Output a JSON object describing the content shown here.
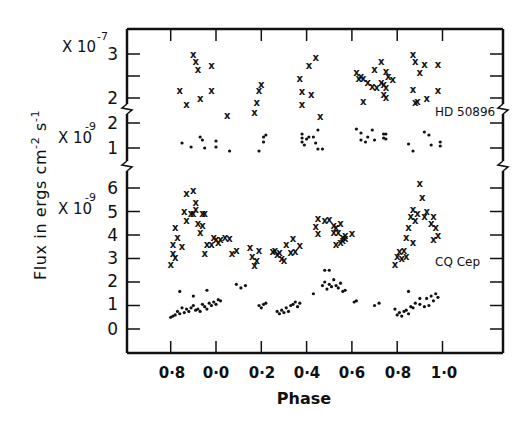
{
  "chart_data": {
    "type": "scatter",
    "title": "",
    "xlabel": "Phase",
    "ylabel": "Flux in ergs cm-2 s-1",
    "x_tick_labels": [
      "0·8",
      "0·0",
      "0·2",
      "0·4",
      "0·6",
      "0·8",
      "1·0"
    ],
    "x_tick_positions": [
      -0.2,
      0.0,
      0.2,
      0.4,
      0.6,
      0.8,
      1.0
    ],
    "xlim": [
      -0.394,
      1.266
    ],
    "grid": false,
    "panels": [
      {
        "name": "HD 50896 (crosses)",
        "scale_label": "X 10-7",
        "scale_base": "X 10",
        "scale_exp": "-7",
        "y_ticks": [
          2,
          3
        ],
        "y_minor_ticks": [
          2.5
        ],
        "ylim": [
          1.8,
          3.57
        ],
        "marker": "x"
      },
      {
        "name": "HD 50896 (dots)",
        "scale_label": "X 10-9",
        "scale_base": "X 10",
        "scale_exp": "-9",
        "y_ticks": [
          1,
          2
        ],
        "ylim": [
          0.32,
          2.64
        ],
        "marker": "dot"
      },
      {
        "name": "CQ Cep",
        "scale_label": "X 10-9",
        "scale_base": "X 10",
        "scale_exp": "-9",
        "y_ticks": [
          0,
          1,
          2,
          3,
          4,
          5,
          6
        ],
        "ylim": [
          -1.0,
          6.9
        ],
        "marker": "both"
      }
    ],
    "annotations": [
      "HD 50896",
      "CQ Cep"
    ],
    "series": [
      {
        "name": "HD 50896 crosses (x10^-7)",
        "panel": 0,
        "marker": "x",
        "x": [
          -0.1,
          -0.09,
          -0.08,
          -0.02,
          -0.16,
          -0.02,
          -0.07,
          -0.13,
          0.05,
          0.19,
          0.18,
          0.17,
          0.2,
          0.37,
          0.41,
          0.44,
          0.38,
          0.42,
          0.38,
          0.46,
          0.62,
          0.64,
          0.63,
          0.65,
          0.67,
          0.69,
          0.7,
          0.71,
          0.73,
          0.73,
          0.74,
          0.75,
          0.75,
          0.65,
          0.76,
          0.78,
          0.74,
          0.75,
          0.87,
          0.88,
          0.92,
          0.9,
          0.87,
          0.89,
          0.88,
          0.93,
          0.98,
          0.98
        ],
        "y": [
          2.98,
          2.84,
          2.64,
          2.73,
          2.16,
          2.16,
          1.98,
          1.85,
          1.6,
          2.16,
          1.89,
          1.66,
          2.3,
          2.45,
          2.73,
          2.91,
          2.14,
          2.09,
          1.86,
          1.57,
          2.57,
          2.5,
          2.45,
          2.45,
          2.36,
          2.27,
          2.64,
          2.25,
          2.82,
          2.36,
          2.09,
          2.02,
          2.61,
          1.93,
          2.5,
          2.43,
          2.3,
          2.25,
          2.98,
          2.84,
          2.77,
          2.57,
          2.2,
          1.91,
          1.89,
          2.0,
          2.77,
          2.16
        ]
      },
      {
        "name": "HD 50896 dots (x10^-9)",
        "panel": 1,
        "marker": "dot",
        "x": [
          -0.15,
          -0.07,
          -0.06,
          -0.11,
          0.0,
          0.0,
          -0.05,
          0.06,
          0.19,
          0.21,
          0.22,
          0.21,
          0.38,
          0.4,
          0.41,
          0.38,
          0.38,
          0.39,
          0.43,
          0.44,
          0.45,
          0.45,
          0.47,
          0.62,
          0.64,
          0.67,
          0.69,
          0.75,
          0.64,
          0.66,
          0.7,
          0.75,
          0.74,
          0.74,
          0.85,
          0.87,
          0.92,
          0.94,
          0.95,
          0.99,
          0.99
        ],
        "y": [
          1.2,
          1.44,
          1.32,
          1.04,
          1.28,
          1.04,
          1.0,
          0.88,
          0.88,
          1.44,
          1.52,
          1.24,
          1.4,
          1.36,
          1.44,
          1.24,
          1.56,
          1.12,
          1.44,
          1.2,
          1.72,
          0.96,
          0.96,
          1.76,
          1.6,
          1.44,
          1.72,
          1.56,
          1.32,
          1.24,
          1.32,
          1.36,
          1.56,
          1.4,
          1.16,
          0.88,
          1.64,
          1.52,
          1.12,
          1.24,
          1.08
        ],
        "note": "markers approximate; scatter read from figure"
      },
      {
        "name": "CQ Cep crosses (x10^-9)",
        "panel": 2,
        "marker": "x",
        "x": [
          -0.2,
          -0.19,
          -0.19,
          -0.18,
          -0.17,
          -0.18,
          -0.15,
          -0.13,
          -0.14,
          -0.13,
          -0.11,
          -0.1,
          -0.09,
          -0.1,
          -0.09,
          -0.08,
          -0.06,
          -0.05,
          -0.06,
          -0.07,
          -0.04,
          -0.02,
          -0.01,
          0.0,
          0.01,
          0.02,
          -0.05,
          0.04,
          0.06,
          0.09,
          0.07,
          0.15,
          0.16,
          0.18,
          0.19,
          0.17,
          0.25,
          0.26,
          0.27,
          0.28,
          0.29,
          0.31,
          0.33,
          0.34,
          0.35,
          0.3,
          0.37,
          0.45,
          0.44,
          0.45,
          0.5,
          0.52,
          0.53,
          0.54,
          0.55,
          0.56,
          0.57,
          0.53,
          0.55,
          0.57,
          0.6,
          0.48,
          0.52,
          0.56,
          0.79,
          0.8,
          0.81,
          0.82,
          0.83,
          0.84,
          0.85,
          0.86,
          0.87,
          0.88,
          0.9,
          0.91,
          0.92,
          0.93,
          0.95,
          0.96,
          0.97,
          0.98,
          0.96,
          0.84,
          0.87,
          0.89
        ],
        "y": [
          2.75,
          3.6,
          3.2,
          3.05,
          3.9,
          4.3,
          3.5,
          4.6,
          5.0,
          5.75,
          4.9,
          4.9,
          5.1,
          5.9,
          5.4,
          4.5,
          4.9,
          4.9,
          4.4,
          4.1,
          3.6,
          3.6,
          3.9,
          3.8,
          3.7,
          3.8,
          3.2,
          3.9,
          3.85,
          3.35,
          3.2,
          3.45,
          3.1,
          2.9,
          3.35,
          2.7,
          3.3,
          3.35,
          3.15,
          3.25,
          3.0,
          3.6,
          3.25,
          3.85,
          3.3,
          2.9,
          3.55,
          4.7,
          4.35,
          4.05,
          4.65,
          4.4,
          4.3,
          4.1,
          4.5,
          3.9,
          3.85,
          3.6,
          3.7,
          4.0,
          4.05,
          4.6,
          4.1,
          3.75,
          2.75,
          3.1,
          3.3,
          3.0,
          3.35,
          3.9,
          4.3,
          4.8,
          5.1,
          4.6,
          6.2,
          5.6,
          4.8,
          5.0,
          4.5,
          4.8,
          4.3,
          4.0,
          3.8,
          3.1,
          3.7,
          4.9
        ],
        "note": "approximate reading from scatter cluster"
      },
      {
        "name": "CQ Cep dots (x10^-9)",
        "panel": 2,
        "marker": "dot",
        "x": [
          -0.2,
          -0.19,
          -0.18,
          -0.17,
          -0.16,
          -0.15,
          -0.14,
          -0.13,
          -0.12,
          -0.11,
          -0.1,
          -0.09,
          -0.08,
          -0.07,
          -0.06,
          -0.05,
          -0.04,
          -0.03,
          -0.02,
          -0.01,
          0.0,
          0.01,
          0.02,
          -0.16,
          -0.1,
          -0.04,
          0.09,
          0.11,
          0.13,
          0.19,
          0.2,
          0.21,
          0.22,
          0.27,
          0.28,
          0.29,
          0.3,
          0.31,
          0.32,
          0.33,
          0.34,
          0.35,
          0.36,
          0.37,
          0.43,
          0.47,
          0.48,
          0.49,
          0.5,
          0.51,
          0.52,
          0.53,
          0.54,
          0.55,
          0.56,
          0.57,
          0.48,
          0.5,
          0.61,
          0.62,
          0.7,
          0.72,
          0.79,
          0.8,
          0.81,
          0.82,
          0.83,
          0.84,
          0.85,
          0.86,
          0.87,
          0.88,
          0.9,
          0.92,
          0.93,
          0.94,
          0.95,
          0.96,
          0.97,
          0.98,
          0.85,
          0.9
        ],
        "y": [
          0.5,
          0.55,
          0.6,
          0.75,
          0.65,
          0.9,
          0.7,
          0.85,
          0.75,
          0.9,
          1.0,
          0.8,
          0.85,
          0.75,
          1.05,
          0.95,
          0.85,
          1.1,
          1.0,
          1.15,
          1.05,
          1.25,
          1.2,
          1.6,
          1.4,
          1.65,
          1.9,
          1.75,
          1.85,
          1.0,
          0.9,
          1.05,
          1.1,
          0.75,
          0.65,
          0.8,
          0.7,
          0.9,
          0.75,
          1.0,
          1.05,
          1.15,
          0.95,
          1.1,
          1.5,
          1.85,
          2.0,
          1.7,
          1.9,
          1.8,
          2.1,
          1.85,
          1.75,
          1.95,
          1.6,
          1.65,
          2.5,
          2.5,
          1.15,
          1.2,
          1.0,
          1.1,
          0.85,
          0.6,
          0.7,
          0.55,
          0.75,
          0.8,
          0.65,
          0.95,
          0.9,
          1.1,
          1.05,
          0.95,
          1.3,
          1.0,
          1.4,
          1.2,
          1.5,
          1.35,
          1.6,
          1.3
        ],
        "note": "approximate reading from scatter cluster"
      }
    ]
  },
  "labels": {
    "xlabel": "Phase",
    "ylabel_main": "Flux in ergs cm",
    "ylabel_exp1": "-2",
    "ylabel_mid": " s",
    "ylabel_exp2": "-1",
    "top_scale_base": "X 10",
    "top_scale_exp": "-7",
    "mid_scale_base": "X 10",
    "mid_scale_exp": "-9",
    "low_scale_base": "X 10",
    "low_scale_exp": "-9",
    "star1": "HD 50896",
    "star2": "CQ Cep",
    "top_ticks": [
      "3",
      "2"
    ],
    "mid_ticks": [
      "2",
      "1"
    ],
    "low_ticks": [
      "6",
      "5",
      "4",
      "3",
      "2",
      "1",
      "0"
    ],
    "x_ticks": [
      "0·8",
      "0·0",
      "0·2",
      "0·4",
      "0·6",
      "0·8",
      "1·0"
    ]
  }
}
